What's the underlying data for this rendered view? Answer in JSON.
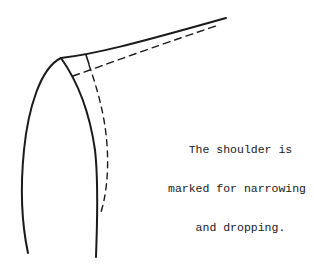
{
  "figure": {
    "caption_lines": [
      "   The shoulder is",
      "marked for narrowing",
      "    and dropping."
    ],
    "stroke_color": "#1a1a1a",
    "background": "#ffffff"
  }
}
